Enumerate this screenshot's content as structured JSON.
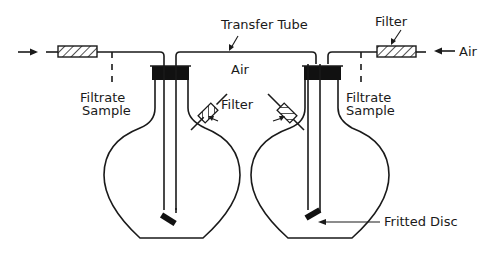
{
  "diagram": {
    "type": "apparatus-schematic",
    "labels": {
      "transfer_tube": "Transfer Tube",
      "filter_top_right": "Filter",
      "air_inlet_right": "Air",
      "air_center": "Air",
      "filter_center": "Filter",
      "filtrate_sample_left_line1": "Filtrate",
      "filtrate_sample_left_line2": "Sample",
      "filtrate_sample_right_line1": "Filtrate",
      "filtrate_sample_right_line2": "Sample",
      "fritted_disc": "Fritted Disc"
    },
    "components": [
      {
        "name": "left-flask",
        "kind": "round-bottom flask with black stopper"
      },
      {
        "name": "right-flask",
        "kind": "round-bottom flask with black stopper"
      },
      {
        "name": "transfer-tube",
        "kind": "tube connecting both flasks"
      },
      {
        "name": "inlet-filter-left",
        "kind": "hatched filter cartridge"
      },
      {
        "name": "inlet-filter-right",
        "kind": "hatched filter cartridge"
      },
      {
        "name": "vent-filter-left",
        "kind": "diagonal hatched filter"
      },
      {
        "name": "vent-filter-right",
        "kind": "diagonal hatched filter"
      },
      {
        "name": "fritted-disc-left",
        "kind": "fritted disc at tube end"
      },
      {
        "name": "fritted-disc-right",
        "kind": "fritted disc at tube end"
      }
    ],
    "colors": {
      "ink": "#1a1a1a",
      "background": "#ffffff"
    }
  }
}
